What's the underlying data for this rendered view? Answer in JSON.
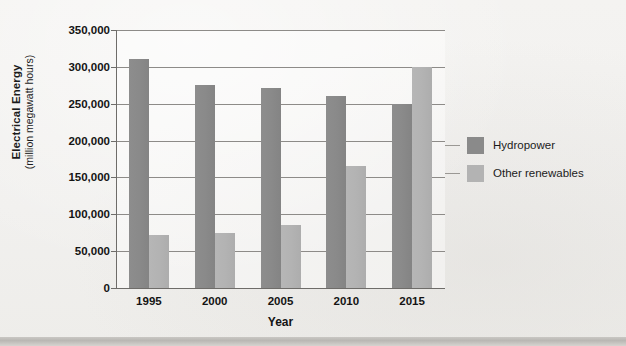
{
  "chart_data": {
    "type": "bar",
    "title": "",
    "xlabel": "Year",
    "ylabel": "Electrical Energy",
    "ylabel_sub": "(million megawatt hours)",
    "categories": [
      "1995",
      "2000",
      "2005",
      "2010",
      "2015"
    ],
    "ylim": [
      0,
      350000
    ],
    "ytick_step": 50000,
    "ytick_labels": [
      "0",
      "50,000",
      "100,000",
      "150,000",
      "200,000",
      "250,000",
      "300,000",
      "350,000"
    ],
    "ytick_values": [
      0,
      50000,
      100000,
      150000,
      200000,
      250000,
      300000,
      350000
    ],
    "grid": true,
    "legend_position": "right",
    "series": [
      {
        "name": "Hydropower",
        "color": "#8a8a8a",
        "values": [
          311000,
          276000,
          271000,
          260000,
          250000
        ]
      },
      {
        "name": "Other renewables",
        "color": "#b3b3b3",
        "values": [
          72000,
          75000,
          86000,
          166000,
          300000
        ]
      }
    ]
  },
  "figure": {
    "background_color": "#f2f1ef",
    "axis_color": "#6e6c69",
    "grid_color": "#8d8b88",
    "text_color": "#141414"
  }
}
